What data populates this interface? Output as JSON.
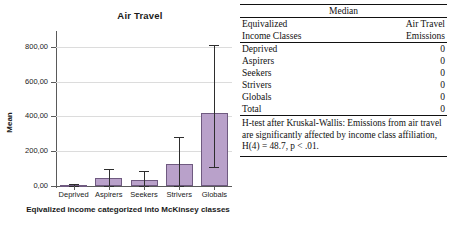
{
  "chart_data": {
    "type": "bar",
    "title": "Air Travel",
    "xlabel": "Eqivalized income categorized into McKinsey classes",
    "ylabel": "Mean",
    "categories": [
      "Deprived",
      "Aspirers",
      "Seekers",
      "Strivers",
      "Globals"
    ],
    "values": [
      3,
      44,
      36,
      126,
      420
    ],
    "error_low": [
      0,
      0,
      0,
      0,
      110
    ],
    "error_high": [
      10,
      100,
      88,
      283,
      810
    ],
    "ylim": [
      0,
      880
    ],
    "yticks": [
      0,
      200,
      400,
      600,
      800
    ],
    "ytick_labels": [
      "0,00",
      "200,00",
      "400,00",
      "600,00",
      "800,00"
    ],
    "grid": true,
    "legend": "none",
    "bar_color": "#b9a1ca",
    "bar_border_color": "#6f5a80",
    "error_bar_color": "#2e2e2e"
  },
  "table": {
    "caption": "Median",
    "columns": [
      {
        "line1": "Equivalized",
        "line2": "Income Classes"
      },
      {
        "line1": "Air Travel",
        "line2": "Emissions"
      }
    ],
    "rows": [
      {
        "label": "Deprived",
        "value": "0"
      },
      {
        "label": "Aspirers",
        "value": "0"
      },
      {
        "label": "Seekers",
        "value": "0"
      },
      {
        "label": "Strivers",
        "value": "0"
      },
      {
        "label": "Globals",
        "value": "0"
      },
      {
        "label": "Total",
        "value": "0"
      }
    ],
    "note": "H-test after Kruskal-Wallis: Emissions from air travel are significantly affected by income class affiliation, H(4) = 48.7, p < .01."
  }
}
